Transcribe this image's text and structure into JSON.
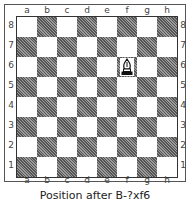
{
  "files": [
    "a",
    "b",
    "c",
    "d",
    "e",
    "f",
    "g",
    "h"
  ],
  "ranks": [
    "8",
    "7",
    "6",
    "5",
    "4",
    "3",
    "2",
    "1"
  ],
  "pieces": [
    {
      "square": "f6",
      "piece": "white-bishop"
    }
  ],
  "caption": "Position after B-?xf6"
}
